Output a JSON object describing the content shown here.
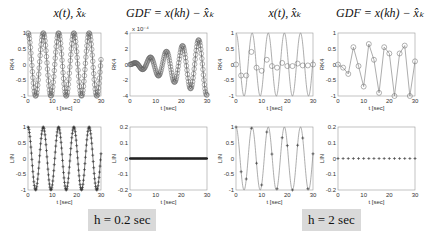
{
  "titles": {
    "col1": "x(t), x̂ₖ",
    "col2": "GDF = x(kh) − x̂ₖ",
    "col3": "x(t), x̂ₖ",
    "col4": "GDF = x(kh) − x̂ₖ"
  },
  "step_labels": {
    "left": "h = 0.2 sec",
    "right": "h = 2 sec"
  },
  "chart_data": [
    {
      "type": "line",
      "panel": "RK4 signal, h=0.2",
      "title": "x(t), x̂_k",
      "xlabel": "t [sec]",
      "ylabel": "RK4",
      "xlim": [
        0,
        30
      ],
      "ylim": [
        -1,
        1
      ],
      "xticks": [
        0,
        10,
        20,
        30
      ],
      "yticks": [
        -1,
        -0.5,
        0,
        0.5,
        1
      ],
      "series": [
        {
          "name": "x(t)",
          "function": "cos(t)",
          "marker": "o",
          "sampling_h": 0.2
        }
      ]
    },
    {
      "type": "line",
      "panel": "RK4 GDF, h=0.2",
      "title": "GDF = x(kh) - x̂_k",
      "xlabel": "t [sec]",
      "ylabel": "RK4",
      "xlim": [
        0,
        30
      ],
      "ylim": [
        -4,
        4
      ],
      "y_scale_note": "x 10^-4",
      "xticks": [
        0,
        10,
        20,
        30
      ],
      "yticks": [
        -4,
        -2,
        0,
        2,
        4
      ],
      "series": [
        {
          "name": "GDF",
          "description": "growing oscillation, amplitude ~0 to ~3.7e-4",
          "marker": "o"
        }
      ]
    },
    {
      "type": "line",
      "panel": "LIN signal, h=0.2",
      "title": "",
      "xlabel": "t [sec]",
      "ylabel": "LIN",
      "xlim": [
        0,
        30
      ],
      "ylim": [
        -1,
        1
      ],
      "xticks": [
        0,
        10,
        20,
        30
      ],
      "yticks": [
        -1,
        -0.5,
        0,
        0.5,
        1
      ],
      "series": [
        {
          "name": "x(t)",
          "function": "cos(t)",
          "marker": "+",
          "sampling_h": 0.2
        }
      ]
    },
    {
      "type": "line",
      "panel": "LIN GDF, h=0.2",
      "title": "",
      "xlabel": "t [sec]",
      "ylabel": "LIN",
      "xlim": [
        0,
        30
      ],
      "ylim": [
        -0.2,
        0.2
      ],
      "xticks": [
        0,
        10,
        20,
        30
      ],
      "yticks": [
        -0.2,
        -0.1,
        0,
        0.1,
        0.2
      ],
      "series": [
        {
          "name": "GDF",
          "values_constant": 0,
          "marker": "*"
        }
      ]
    },
    {
      "type": "line",
      "panel": "RK4 signal, h=2",
      "title": "x(t), x̂_k",
      "xlabel": "t [sec]",
      "ylabel": "RK4",
      "xlim": [
        0,
        30
      ],
      "ylim": [
        -1,
        1
      ],
      "xticks": [
        0,
        10,
        20,
        30
      ],
      "yticks": [
        -1,
        -0.5,
        0,
        0.5,
        1
      ],
      "series": [
        {
          "name": "x(t)",
          "function": "cos(t)",
          "marker": "none"
        },
        {
          "name": "x̂_k",
          "marker": "o",
          "x": [
            0,
            2,
            4,
            6,
            8,
            10,
            12,
            14,
            16,
            18,
            20,
            22,
            24,
            26,
            28,
            30
          ],
          "values": [
            0,
            -0.35,
            -0.35,
            0.4,
            -0.1,
            -0.2,
            0.15,
            -0.05,
            -0.1,
            0.05,
            -0.05,
            -0.05,
            0.03,
            -0.03,
            -0.03,
            0.0
          ]
        }
      ]
    },
    {
      "type": "line",
      "panel": "RK4 GDF, h=2",
      "title": "GDF = x(kh) - x̂_k",
      "xlabel": "t [sec]",
      "ylabel": "RK4",
      "xlim": [
        0,
        30
      ],
      "ylim": [
        -1,
        1
      ],
      "xticks": [
        0,
        10,
        20,
        30
      ],
      "yticks": [
        -1,
        -0.5,
        0,
        0.5,
        1
      ],
      "series": [
        {
          "name": "GDF",
          "marker": "o",
          "x": [
            0,
            2,
            4,
            6,
            8,
            10,
            12,
            14,
            16,
            18,
            20,
            22,
            24,
            26,
            28,
            30
          ],
          "values": [
            0,
            -0.1,
            -0.3,
            0.55,
            -0.05,
            -0.7,
            0.65,
            0.15,
            -0.9,
            0.55,
            0.35,
            -1.0,
            0.35,
            0.6,
            -1.0,
            0.1
          ]
        }
      ]
    },
    {
      "type": "line",
      "panel": "LIN signal, h=2",
      "title": "",
      "xlabel": "t [sec]",
      "ylabel": "LIN",
      "xlim": [
        0,
        30
      ],
      "ylim": [
        -1,
        1
      ],
      "xticks": [
        0,
        10,
        20,
        30
      ],
      "yticks": [
        -1,
        -0.5,
        0,
        0.5,
        1
      ],
      "series": [
        {
          "name": "x(t)",
          "function": "cos(t)",
          "marker": "none"
        },
        {
          "name": "x̂_k",
          "marker": "+",
          "x": [
            0,
            2,
            4,
            6,
            8,
            10,
            12,
            14,
            16,
            18,
            20,
            22,
            24,
            26,
            28,
            30
          ],
          "values": [
            1,
            -0.42,
            -0.65,
            0.96,
            -0.15,
            -0.84,
            0.84,
            0.14,
            -0.96,
            0.66,
            0.41,
            -1.0,
            0.42,
            0.65,
            -0.96,
            0.15
          ]
        }
      ]
    },
    {
      "type": "line",
      "panel": "LIN GDF, h=2",
      "title": "",
      "xlabel": "t [sec]",
      "ylabel": "LIN",
      "xlim": [
        0,
        30
      ],
      "ylim": [
        -0.2,
        0.2
      ],
      "xticks": [
        0,
        10,
        20,
        30
      ],
      "yticks": [
        -0.2,
        -0.1,
        0,
        0.1,
        0.2
      ],
      "series": [
        {
          "name": "GDF",
          "values_constant": 0,
          "marker": "+",
          "x": [
            0,
            2,
            4,
            6,
            8,
            10,
            12,
            14,
            16,
            18,
            20,
            22,
            24,
            26,
            28,
            30
          ]
        }
      ]
    }
  ]
}
